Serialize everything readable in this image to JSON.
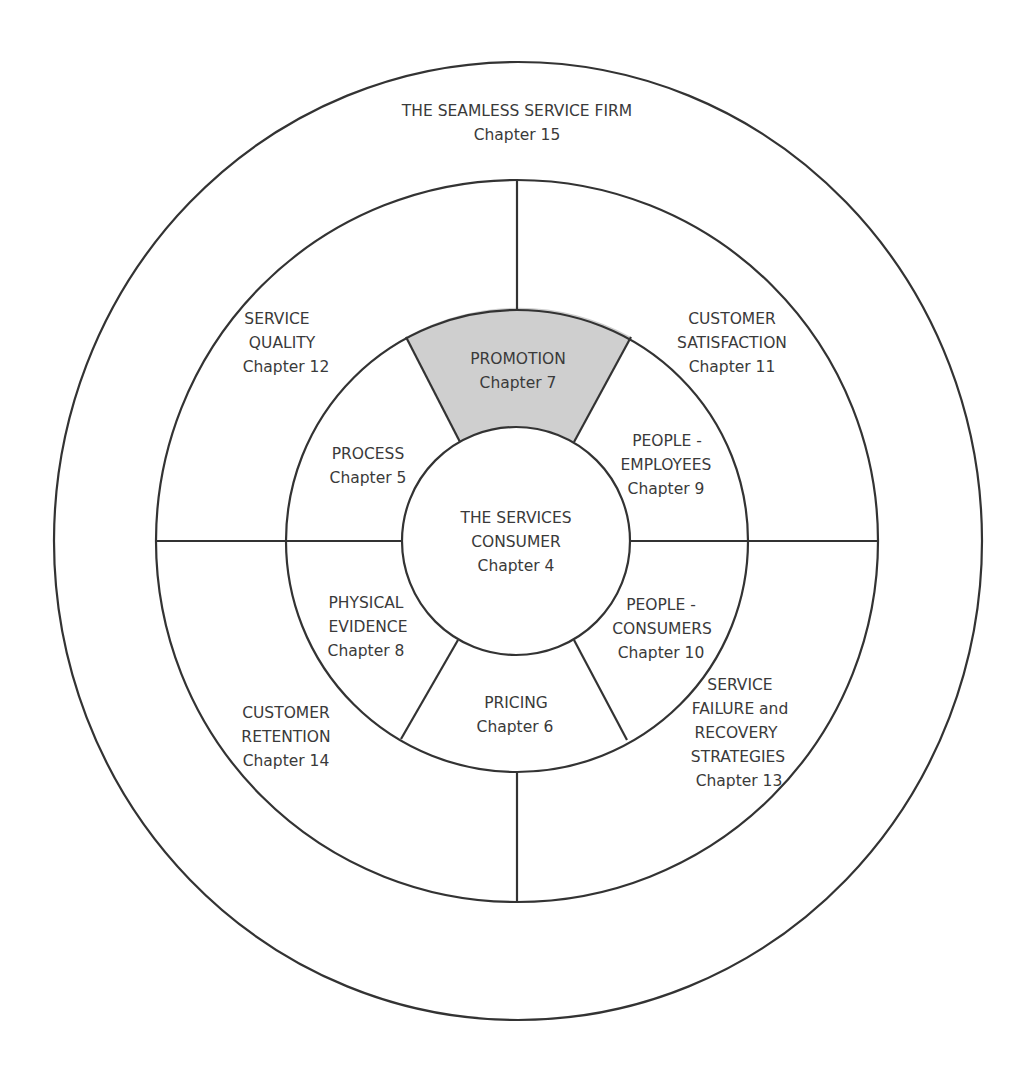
{
  "diagram": {
    "colors": {
      "line": "#333333",
      "text": "#3a3a3a",
      "highlight_fill": "#cfcfcf",
      "background": "#ffffff"
    },
    "outer_ring": {
      "title": "THE SEAMLESS SERVICE FIRM",
      "chapter": "Chapter 15"
    },
    "middle_ring": [
      {
        "line1": "SERVICE",
        "line2": "QUALITY",
        "chapter": "Chapter 12"
      },
      {
        "line1": "CUSTOMER",
        "line2": "SATISFACTION",
        "chapter": "Chapter 11"
      },
      {
        "line1": "CUSTOMER",
        "line2": "RETENTION",
        "chapter": "Chapter 14"
      },
      {
        "line1": "SERVICE",
        "line2": "FAILURE and",
        "line3": "RECOVERY",
        "line4": "STRATEGIES",
        "chapter": "Chapter 13"
      }
    ],
    "inner_ring": [
      {
        "line1": "PROMOTION",
        "chapter": "Chapter 7",
        "highlighted": true
      },
      {
        "line1": "PEOPLE -",
        "line2": "EMPLOYEES",
        "chapter": "Chapter 9"
      },
      {
        "line1": "PEOPLE -",
        "line2": "CONSUMERS",
        "chapter": "Chapter 10"
      },
      {
        "line1": "PRICING",
        "chapter": "Chapter 6"
      },
      {
        "line1": "PHYSICAL",
        "line2": "EVIDENCE",
        "chapter": "Chapter 8"
      },
      {
        "line1": "PROCESS",
        "chapter": "Chapter 5"
      }
    ],
    "center": {
      "line1": "THE SERVICES",
      "line2": "CONSUMER",
      "chapter": "Chapter 4"
    }
  }
}
